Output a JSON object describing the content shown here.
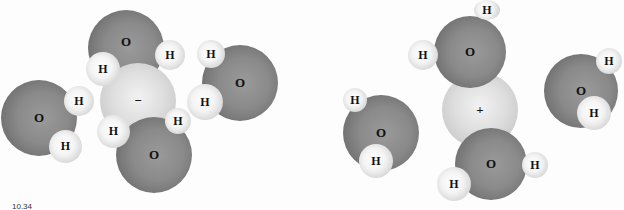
{
  "figure": {
    "left_panel": {
      "ion_label": "−",
      "ion_type": "anion",
      "atom_labels": {
        "oxygen": "O",
        "hydrogen": "H"
      },
      "water_molecule_count": 4
    },
    "right_panel": {
      "ion_label": "+",
      "ion_type": "cation",
      "atom_labels": {
        "oxygen": "O",
        "hydrogen": "H"
      },
      "water_molecule_count": 4
    },
    "caption_fragment": "10.34"
  },
  "labels": {
    "O": "O",
    "H": "H",
    "minus": "−",
    "plus": "+"
  }
}
